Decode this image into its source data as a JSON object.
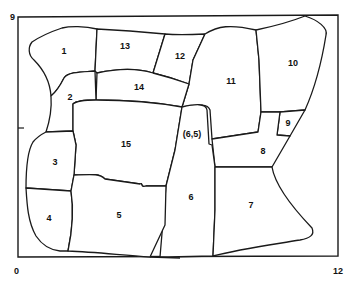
{
  "map": {
    "axis": {
      "y_max_label": "9",
      "origin_label": "0",
      "x_max_label": "12"
    },
    "colors": {
      "line": "#1a1a1a",
      "background": "#ffffff"
    },
    "parcels": [
      {
        "id": "1",
        "label": "1"
      },
      {
        "id": "2",
        "label": "2"
      },
      {
        "id": "3",
        "label": "3"
      },
      {
        "id": "4",
        "label": "4"
      },
      {
        "id": "5",
        "label": "5"
      },
      {
        "id": "6",
        "label": "6"
      },
      {
        "id": "6.5",
        "label": "(6,5)"
      },
      {
        "id": "7",
        "label": "7"
      },
      {
        "id": "8",
        "label": "8"
      },
      {
        "id": "9",
        "label": "9"
      },
      {
        "id": "10",
        "label": "10"
      },
      {
        "id": "11",
        "label": "11"
      },
      {
        "id": "12",
        "label": "12"
      },
      {
        "id": "13",
        "label": "13"
      },
      {
        "id": "14",
        "label": "14"
      },
      {
        "id": "15",
        "label": "15"
      }
    ]
  }
}
